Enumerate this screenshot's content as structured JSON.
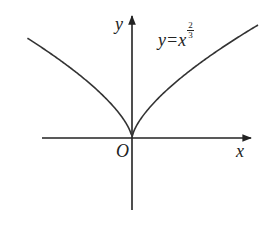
{
  "chart_data": {
    "type": "line",
    "title": "",
    "function": "y = x^(2/3)",
    "xlabel": "x",
    "ylabel": "y",
    "origin_label": "O",
    "curve_label": {
      "lhs": "y=x",
      "exponent_numerator": "2",
      "exponent_denominator": "3"
    },
    "series": [
      {
        "name": "y=x^(2/3)",
        "x": [
          -1.0,
          -0.75,
          -0.5,
          -0.25,
          -0.1,
          0,
          0.1,
          0.25,
          0.5,
          0.75,
          1.0
        ],
        "values": [
          1.0,
          0.825,
          0.63,
          0.397,
          0.215,
          0,
          0.215,
          0.397,
          0.63,
          0.825,
          1.0
        ]
      }
    ],
    "grid": false,
    "ticks": false,
    "legend": "none",
    "colors": {
      "curve": "#333333",
      "axes": "#222222",
      "background": "#ffffff"
    }
  }
}
